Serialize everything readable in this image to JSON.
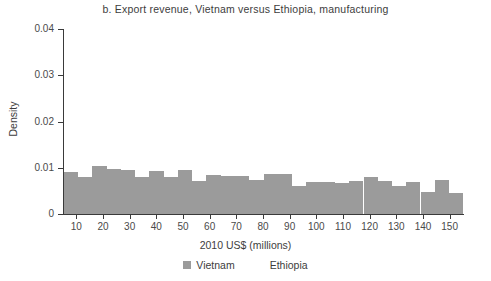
{
  "chart_data": {
    "type": "bar",
    "title": "b. Export revenue, Vietnam versus Ethiopia, manufacturing",
    "xlabel": "2010 US$ (millions)",
    "ylabel": "Density",
    "xlim": [
      5,
      155
    ],
    "ylim": [
      0,
      0.04
    ],
    "grid": false,
    "legend_position": "bottom",
    "xticks": [
      10,
      20,
      30,
      40,
      50,
      60,
      70,
      80,
      90,
      100,
      110,
      120,
      130,
      140,
      150
    ],
    "xtick_labels": [
      "10",
      "20",
      "30",
      "40",
      "50",
      "60",
      "70",
      "80",
      "90",
      "100",
      "110",
      "120",
      "130",
      "140",
      "150"
    ],
    "yticks": [
      0,
      0.01,
      0.02,
      0.03,
      0.04
    ],
    "ytick_labels": [
      "0",
      "0.01",
      "0.02",
      "0.03",
      "0.04"
    ],
    "bin_width": 5.35,
    "bin_starts": [
      5.3,
      10.7,
      16.0,
      21.4,
      26.7,
      32.1,
      37.4,
      42.8,
      48.1,
      53.5,
      58.8,
      64.2,
      69.5,
      74.9,
      80.2,
      85.6,
      90.9,
      96.3,
      101.6,
      107.0,
      112.3,
      117.7,
      123.0,
      128.4,
      133.7,
      139.1,
      144.4,
      149.8
    ],
    "series": [
      {
        "name": "Vietnam",
        "color": "#9b9b9b",
        "values": [
          0.0091,
          0.0079,
          0.0103,
          0.0098,
          0.0096,
          0.0081,
          0.0093,
          0.0079,
          0.0095,
          0.0072,
          0.0084,
          0.0083,
          0.0083,
          0.0074,
          0.0086,
          0.0086,
          0.006,
          0.0069,
          0.0069,
          0.0067,
          0.0071,
          0.0081,
          0.0071,
          0.006,
          0.0069,
          0.0047,
          0.0074,
          0.0045
        ]
      },
      {
        "name": "Ethiopia",
        "color": "#ffffff",
        "values": []
      }
    ]
  },
  "legend": {
    "entries": [
      {
        "label": "Vietnam",
        "color": "#9b9b9b"
      },
      {
        "label": "Ethiopia",
        "color": "#ffffff"
      }
    ]
  }
}
